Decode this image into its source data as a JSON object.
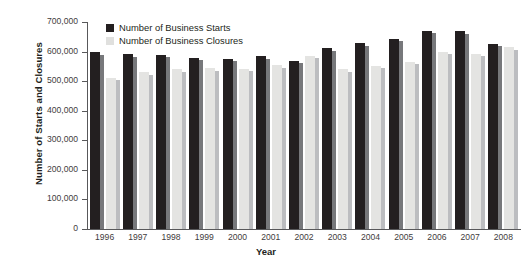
{
  "chart_data": {
    "type": "bar",
    "title": "",
    "xlabel": "Year",
    "ylabel": "Number of Starts and Closures",
    "ylim": [
      0,
      700000
    ],
    "ytick_step": 100000,
    "grid": false,
    "legend_position": "top-left-inside",
    "ytick_labels": [
      "0",
      "100,000",
      "200,000",
      "300,000",
      "400,000",
      "500,000",
      "600,000",
      "700,000"
    ],
    "ytick_values": [
      0,
      100000,
      200000,
      300000,
      400000,
      500000,
      600000,
      700000
    ],
    "categories": [
      "1996",
      "1997",
      "1998",
      "1999",
      "2000",
      "2001",
      "2002",
      "2003",
      "2004",
      "2005",
      "2006",
      "2007",
      "2008"
    ],
    "series": [
      {
        "name": "Number of Business Starts",
        "color": "#231f20",
        "values": [
          598000,
          591000,
          590000,
          580000,
          575000,
          585000,
          569000,
          612000,
          628000,
          644000,
          670000,
          668000,
          627000
        ]
      },
      {
        "name": "Number of Business Closures",
        "color": "#e4e4e2",
        "values": [
          512000,
          530000,
          540000,
          544000,
          542000,
          553000,
          586000,
          541000,
          552000,
          565000,
          599000,
          592000,
          614000
        ]
      }
    ]
  },
  "legend": {
    "items": [
      {
        "label": "Number of Business Starts",
        "swatch": "swatch-starts"
      },
      {
        "label": "Number of Business Closures",
        "swatch": "swatch-closures"
      }
    ]
  },
  "axes": {
    "y_title": "Number of Starts and Closures",
    "x_title": "Year"
  },
  "colors": {
    "starts": "#231f20",
    "closures": "#e4e4e2",
    "starts_shadow": "#77787b",
    "closures_shadow": "#bcbdc0",
    "axis": "#58585a",
    "text": "#231f20",
    "background": "#ffffff"
  }
}
